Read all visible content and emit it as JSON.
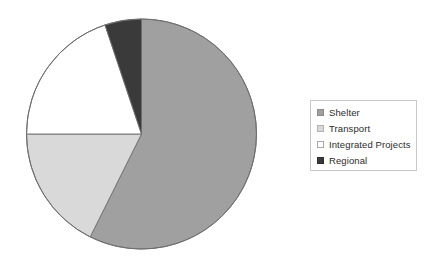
{
  "chart_data": {
    "type": "pie",
    "title": "",
    "subtitle": "",
    "xlabel": "",
    "ylabel": "",
    "grid": false,
    "legend_position": "right",
    "start_angle_deg": 0,
    "direction": "clockwise",
    "categories": [
      "Shelter",
      "Transport",
      "Integrated Projects",
      "Regional"
    ],
    "values": [
      57.4,
      17.6,
      19.9,
      5.1
    ],
    "units": "percent",
    "slices": [
      {
        "label": "Shelter",
        "value": 57.4,
        "color": "#a0a0a0",
        "start_angle_deg": 0,
        "end_angle_deg": 206.5,
        "sweep_deg": 206.5
      },
      {
        "label": "Transport",
        "value": 17.6,
        "color": "#d9d9d9",
        "start_angle_deg": 206.5,
        "end_angle_deg": 270.0,
        "sweep_deg": 63.5
      },
      {
        "label": "Integrated Projects",
        "value": 19.9,
        "color": "#ffffff",
        "start_angle_deg": 270.0,
        "end_angle_deg": 341.5,
        "sweep_deg": 71.5
      },
      {
        "label": "Regional",
        "value": 5.1,
        "color": "#3a3a3a",
        "start_angle_deg": 341.5,
        "end_angle_deg": 360.0,
        "sweep_deg": 18.5
      }
    ],
    "geometry": {
      "center_x": 141.5,
      "center_y": 134,
      "radius": 115,
      "outline_color": "#6e6e6e"
    }
  },
  "legend": {
    "items": [
      {
        "label": "Shelter",
        "color": "#a0a0a0",
        "swatch_border": "#8a8a8a"
      },
      {
        "label": "Transport",
        "color": "#d9d9d9",
        "swatch_border": "#b2b2b2"
      },
      {
        "label": "Integrated Projects",
        "color": "#ffffff",
        "swatch_border": "#a8a8a8"
      },
      {
        "label": "Regional",
        "color": "#3a3a3a",
        "swatch_border": "#2e2e2e"
      }
    ],
    "border_color": "#c9c9c9"
  }
}
